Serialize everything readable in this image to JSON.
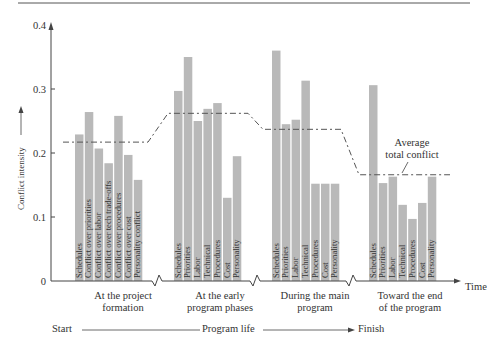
{
  "chart_data": {
    "type": "bar",
    "title": "",
    "ylabel": "Conflict intensity",
    "xlabel": "Time",
    "ylim": [
      0,
      0.4
    ],
    "yticks": [
      "0",
      "0.1",
      "0.2",
      "0.3",
      "0.4"
    ],
    "grid": false,
    "groups": [
      {
        "name": "At the project formation",
        "labels": [
          "Schedules",
          "Conflict over priorities",
          "Conflict over labor",
          "Conflict over tech trade-offs",
          "Conflict over procedures",
          "Conflict over cost",
          "Personality conflict"
        ],
        "values": [
          0.229,
          0.264,
          0.207,
          0.184,
          0.258,
          0.197,
          0.158
        ],
        "average": 0.217
      },
      {
        "name": "At the early program phases",
        "labels": [
          "Schedules",
          "Priorities",
          "Labor",
          "Technical",
          "Procedures",
          "Cost",
          "Personality"
        ],
        "values": [
          0.297,
          0.35,
          0.25,
          0.269,
          0.278,
          0.13,
          0.195
        ],
        "average": 0.262
      },
      {
        "name": "During the main program",
        "labels": [
          "Schedules",
          "Priorities",
          "Labor",
          "Technical",
          "Procedures",
          "Cost",
          "Personality"
        ],
        "values": [
          0.36,
          0.245,
          0.252,
          0.313,
          0.152,
          0.152,
          0.152
        ],
        "average": 0.237
      },
      {
        "name": "Toward the end of the program",
        "labels": [
          "Schedules",
          "Priorities",
          "Labor",
          "Technical",
          "Procedures",
          "Cost",
          "Personality"
        ],
        "values": [
          0.306,
          0.153,
          0.163,
          0.119,
          0.097,
          0.122,
          0.163
        ],
        "average": 0.166
      }
    ],
    "annotations": [
      "Average total conflict"
    ],
    "legend": null
  },
  "axis": {
    "ylabel": "Conflict intensity",
    "time_label": "Time",
    "avg_label_line1": "Average",
    "avg_label_line2": "total conflict"
  },
  "phases": [
    {
      "line1": "At the project",
      "line2": "formation"
    },
    {
      "line1": "At the early",
      "line2": "program phases"
    },
    {
      "line1": "During the main",
      "line2": "program"
    },
    {
      "line1": "Toward the end",
      "line2": "of the program"
    }
  ],
  "lifeline": {
    "start": "Start",
    "middle": "Program life",
    "finish": "Finish"
  },
  "colors": {
    "bar": "#b9b9b9",
    "axis": "#444444",
    "text": "#333333"
  }
}
